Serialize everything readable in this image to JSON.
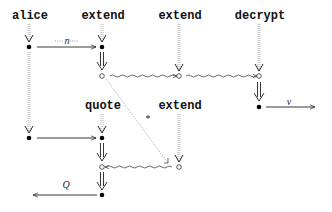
{
  "diagram": {
    "type": "protocol-strand-diagram",
    "nodes": {
      "alice": {
        "label": "alice",
        "x": 29,
        "y": 16
      },
      "extend1": {
        "label": "extend",
        "x": 102,
        "y": 16
      },
      "extend2": {
        "label": "extend",
        "x": 179,
        "y": 16
      },
      "decrypt": {
        "label": "decrypt",
        "x": 259,
        "y": 16
      },
      "quote": {
        "label": "quote",
        "x": 102,
        "y": 106
      },
      "extend3": {
        "label": "extend",
        "x": 179,
        "y": 106
      }
    },
    "edge_labels": {
      "n": "n",
      "v": "v",
      "Q": "Q",
      "star": "*"
    }
  }
}
